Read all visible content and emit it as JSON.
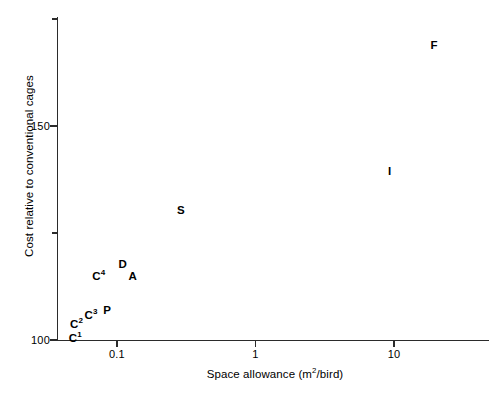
{
  "chart_data": {
    "type": "scatter",
    "title": "",
    "xlabel": "Space allowance (m2/bird)",
    "xlabel_pre": "Space allowance (m",
    "xlabel_sup": "2",
    "xlabel_post": "/bird)",
    "ylabel": "Cost relative to conventional cages",
    "xscale": "log",
    "yscale": "linear",
    "xlim": [
      0.04,
      30
    ],
    "ylim": [
      100,
      175
    ],
    "grid": false,
    "legend": false,
    "xticks": [
      {
        "label": "0.1",
        "value": 0.1
      },
      {
        "label": "1",
        "value": 1
      },
      {
        "label": "10",
        "value": 10
      }
    ],
    "yticks": [
      {
        "label": "150",
        "value": 150,
        "minor": false
      },
      {
        "label": "100",
        "value": 100,
        "minor": false
      },
      {
        "label": "",
        "value": 125,
        "minor": true
      },
      {
        "label": "",
        "value": 175,
        "minor": true
      }
    ],
    "points": [
      {
        "label": "C",
        "sup": "1",
        "x": 0.05,
        "y": 100.5
      },
      {
        "label": "C",
        "sup": "2",
        "x": 0.051,
        "y": 103.8
      },
      {
        "label": "C",
        "sup": "3",
        "x": 0.065,
        "y": 105.8
      },
      {
        "label": "P",
        "sup": "",
        "x": 0.085,
        "y": 107.0
      },
      {
        "label": "C",
        "sup": "4",
        "x": 0.074,
        "y": 115.0
      },
      {
        "label": "D",
        "sup": "",
        "x": 0.11,
        "y": 117.8
      },
      {
        "label": "A",
        "sup": "",
        "x": 0.13,
        "y": 115.0
      },
      {
        "label": "S",
        "sup": "",
        "x": 0.29,
        "y": 130.3
      },
      {
        "label": "I",
        "sup": "",
        "x": 9.3,
        "y": 139.5
      },
      {
        "label": "F",
        "sup": "",
        "x": 19.5,
        "y": 169.0
      }
    ]
  }
}
